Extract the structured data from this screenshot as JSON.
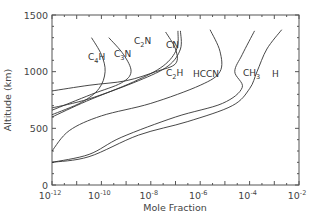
{
  "chart_data": {
    "type": "line",
    "title": "",
    "xlabel": "Mole Fraction",
    "ylabel": "Altitude (km)",
    "xscale": "log",
    "xlim": [
      1e-12,
      0.01
    ],
    "ylim": [
      0,
      1500
    ],
    "grid": false,
    "legend": "inline curve labels",
    "x_ticks": [
      {
        "label": "10",
        "exp": "-12",
        "value": 1e-12
      },
      {
        "label": "10",
        "exp": "-10",
        "value": 1e-10
      },
      {
        "label": "10",
        "exp": "-8",
        "value": 1e-08
      },
      {
        "label": "10",
        "exp": "-6",
        "value": 1e-06
      },
      {
        "label": "10",
        "exp": "-4",
        "value": 0.0001
      },
      {
        "label": "10",
        "exp": "-2",
        "value": 0.01
      }
    ],
    "y_ticks": [
      0,
      500,
      1000,
      1500
    ],
    "series": [
      {
        "name": "C4H",
        "label_main": "C",
        "label_sub": "4",
        "label_tail": "H",
        "points_log10x_alt": [
          [
            -10.4,
            1300
          ],
          [
            -10.0,
            1150
          ],
          [
            -9.85,
            1000
          ],
          [
            -10.1,
            850
          ],
          [
            -10.8,
            730
          ],
          [
            -12.0,
            620
          ]
        ]
      },
      {
        "name": "C3N",
        "label_main": "C",
        "label_sub": "3",
        "label_tail": "N",
        "points_log10x_alt": [
          [
            -9.7,
            1300
          ],
          [
            -9.1,
            1150
          ],
          [
            -8.8,
            1000
          ],
          [
            -9.2,
            900
          ],
          [
            -10.4,
            800
          ],
          [
            -12.0,
            660
          ]
        ]
      },
      {
        "name": "C2N",
        "label_main": "C",
        "label_sub": "2",
        "label_tail": "N",
        "points_log10x_alt": [
          [
            -7.4,
            1350
          ],
          [
            -7.0,
            1200
          ],
          [
            -7.0,
            1070
          ],
          [
            -7.8,
            1000
          ],
          [
            -9.0,
            920
          ],
          [
            -10.5,
            880
          ],
          [
            -12.0,
            830
          ]
        ]
      },
      {
        "name": "CN",
        "label_main": "CN",
        "label_sub": "",
        "label_tail": "",
        "points_log10x_alt": [
          [
            -6.8,
            1360
          ],
          [
            -6.8,
            1200
          ],
          [
            -7.3,
            1050
          ],
          [
            -8.5,
            920
          ],
          [
            -10.5,
            760
          ],
          [
            -12.0,
            680
          ]
        ]
      },
      {
        "name": "C2H",
        "label_main": "C",
        "label_sub": "2",
        "label_tail": "H",
        "points_log10x_alt": [
          [
            -6.9,
            1360
          ],
          [
            -6.95,
            1200
          ],
          [
            -7.5,
            1050
          ],
          [
            -8.7,
            910
          ],
          [
            -10.6,
            740
          ],
          [
            -12.0,
            600
          ]
        ]
      },
      {
        "name": "HCCN",
        "label_main": "HCCN",
        "label_sub": "",
        "label_tail": "",
        "points_log10x_alt": [
          [
            -5.6,
            1370
          ],
          [
            -5.2,
            1180
          ],
          [
            -5.2,
            1000
          ],
          [
            -6.0,
            880
          ],
          [
            -8.0,
            720
          ],
          [
            -10.0,
            610
          ],
          [
            -11.3,
            480
          ],
          [
            -12.0,
            300
          ]
        ]
      },
      {
        "name": "CH3",
        "label_main": "CH",
        "label_sub": "3",
        "label_tail": "",
        "points_log10x_alt": [
          [
            -3.8,
            1360
          ],
          [
            -4.3,
            1150
          ],
          [
            -4.6,
            1000
          ],
          [
            -4.3,
            860
          ],
          [
            -5.1,
            720
          ],
          [
            -7.0,
            600
          ],
          [
            -9.2,
            420
          ],
          [
            -10.5,
            270
          ],
          [
            -12.0,
            200
          ]
        ]
      },
      {
        "name": "H",
        "label_main": "H",
        "label_sub": "",
        "label_tail": "",
        "points_log10x_alt": [
          [
            -2.7,
            1370
          ],
          [
            -3.3,
            1200
          ],
          [
            -3.7,
            1000
          ],
          [
            -4.0,
            850
          ],
          [
            -4.7,
            700
          ],
          [
            -6.5,
            560
          ],
          [
            -8.5,
            440
          ],
          [
            -10.5,
            250
          ],
          [
            -12.0,
            200
          ]
        ]
      }
    ]
  }
}
